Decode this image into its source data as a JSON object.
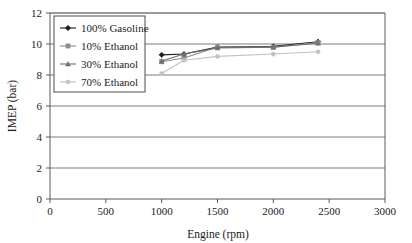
{
  "chart_data": {
    "type": "line",
    "title": "",
    "xlabel": "Engine (rpm)",
    "ylabel": "IMEP (bar)",
    "xlim": [
      0,
      3000
    ],
    "ylim": [
      0,
      12
    ],
    "xticks": [
      0,
      500,
      1000,
      1500,
      2000,
      2500,
      3000
    ],
    "yticks": [
      0,
      2,
      4,
      6,
      8,
      10,
      12
    ],
    "xtick_labels": [
      "0",
      "500",
      "1000",
      "1500",
      "2000",
      "2500",
      "3000"
    ],
    "ytick_labels": [
      "0",
      "2",
      "4",
      "6",
      "8",
      "10",
      "12"
    ],
    "grid": "horizontal",
    "legend_position": "upper-left",
    "series": [
      {
        "name": "100% Gasoline",
        "color": "#1c1c1c",
        "marker": "diamond",
        "x": [
          1000,
          1200,
          1500,
          2000,
          2400
        ],
        "values": [
          9.3,
          9.35,
          9.8,
          9.85,
          10.15
        ]
      },
      {
        "name": "10% Ethanol",
        "color": "#8d8d8d",
        "marker": "square",
        "x": [
          1000,
          1200,
          1500,
          2000,
          2400
        ],
        "values": [
          8.85,
          9.1,
          9.8,
          9.8,
          10.1
        ]
      },
      {
        "name": "30% Ethanol",
        "color": "#707070",
        "marker": "triangle",
        "x": [
          1000,
          1200,
          1500,
          2000,
          2400
        ],
        "values": [
          8.9,
          9.35,
          9.75,
          9.8,
          10.05
        ]
      },
      {
        "name": "70% Ethanol",
        "color": "#c2c2c2",
        "marker": "dot",
        "x": [
          1000,
          1200,
          1500,
          2000,
          2400
        ],
        "values": [
          8.1,
          8.95,
          9.2,
          9.35,
          9.5
        ]
      }
    ]
  }
}
